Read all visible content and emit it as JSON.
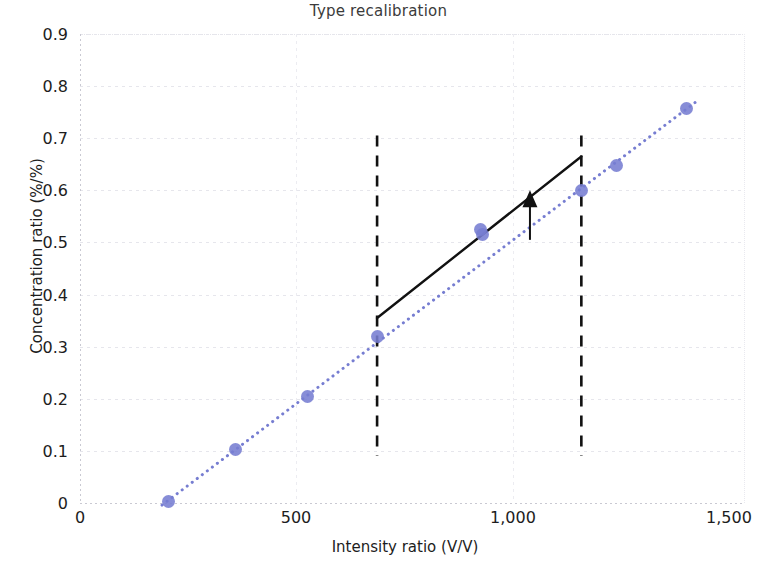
{
  "chart": {
    "title": "Type recalibration",
    "xlabel": "Intensity ratio (V/V)",
    "ylabel": "Concentration ratio (%/%)",
    "xticks": [
      "0",
      "500",
      "1,000",
      "1,500"
    ],
    "yticks": [
      "0.9",
      "0.8",
      "0.7",
      "0.6",
      "0.5",
      "0.4",
      "0.3",
      "0.2",
      "0.1",
      "0"
    ],
    "marker_color": "#767dd1",
    "line_color": "#111111"
  },
  "chart_data": {
    "type": "scatter",
    "title": "Type recalibration",
    "xlabel": "Intensity ratio (V/V)",
    "ylabel": "Concentration ratio (%/%)",
    "xlim": [
      0,
      1540
    ],
    "ylim": [
      0,
      0.9
    ],
    "xticks": [
      0,
      500,
      1000,
      1500
    ],
    "yticks": [
      0,
      0.1,
      0.2,
      0.3,
      0.4,
      0.5,
      0.6,
      0.7,
      0.8,
      0.9
    ],
    "xtick_labels": [
      "0",
      "500",
      "1,000",
      "1,500"
    ],
    "ytick_labels": [
      "0",
      "0.1",
      "0.2",
      "0.3",
      "0.4",
      "0.5",
      "0.6",
      "0.7",
      "0.8",
      "0.9"
    ],
    "grid": true,
    "legend": null,
    "series": [
      {
        "name": "Calibration points",
        "type": "scatter",
        "color": "#767dd1",
        "x": [
          206,
          360,
          527,
          688,
          927,
          932,
          1161,
          1242,
          1405
        ],
        "y": [
          0.003,
          0.103,
          0.205,
          0.32,
          0.525,
          0.515,
          0.6,
          0.648,
          0.757
        ]
      },
      {
        "name": "Original calibration (dotted fit)",
        "type": "line",
        "style": "dotted",
        "color": "#767dd1",
        "x": [
          190,
          1430
        ],
        "y": [
          -0.004,
          0.772
        ]
      },
      {
        "name": "Recalibrated segment (solid)",
        "type": "line",
        "style": "solid",
        "color": "#111111",
        "x": [
          688,
          1161
        ],
        "y": [
          0.355,
          0.665
        ]
      }
    ],
    "annotations": [
      {
        "type": "vline",
        "style": "dashed",
        "color": "#111111",
        "x": 688,
        "y_range": [
          0.09,
          0.705
        ]
      },
      {
        "type": "vline",
        "style": "dashed",
        "color": "#111111",
        "x": 1161,
        "y_range": [
          0.09,
          0.705
        ]
      },
      {
        "type": "arrow",
        "color": "#111111",
        "x": 1042,
        "y_from": 0.505,
        "y_to": 0.585,
        "direction": "up"
      }
    ]
  }
}
